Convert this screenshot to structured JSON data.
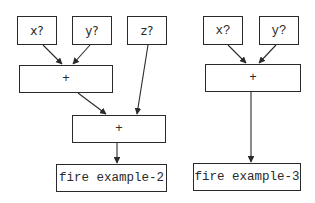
{
  "diagram": {
    "left": {
      "inputs": [
        {
          "id": "x",
          "label": "x?"
        },
        {
          "id": "y",
          "label": "y?"
        },
        {
          "id": "z",
          "label": "z?"
        }
      ],
      "ops": [
        {
          "id": "plus1",
          "label": "+"
        },
        {
          "id": "plus2",
          "label": "+"
        }
      ],
      "output": {
        "label": "fire example-2"
      },
      "edges": [
        [
          "x",
          "plus1"
        ],
        [
          "y",
          "plus1"
        ],
        [
          "plus1",
          "plus2"
        ],
        [
          "z",
          "plus2"
        ],
        [
          "plus2",
          "output"
        ]
      ]
    },
    "right": {
      "inputs": [
        {
          "id": "x",
          "label": "x?"
        },
        {
          "id": "y",
          "label": "y?"
        }
      ],
      "ops": [
        {
          "id": "plus1",
          "label": "+"
        }
      ],
      "output": {
        "label": "fire example-3"
      },
      "edges": [
        [
          "x",
          "plus1"
        ],
        [
          "y",
          "plus1"
        ],
        [
          "plus1",
          "output"
        ]
      ]
    },
    "line_color": "#2a2a2a"
  }
}
